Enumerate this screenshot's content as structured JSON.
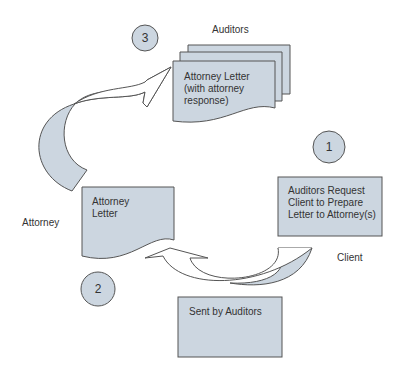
{
  "diagram": {
    "steps": [
      {
        "number": "1",
        "box_text_lines": [
          "Auditors Request",
          "Client to Prepare",
          "Letter to Attorney(s)"
        ],
        "party_label": "Client"
      },
      {
        "number": "2",
        "box_text_lines": [
          "Attorney",
          "Letter"
        ],
        "party_label": "Attorney"
      },
      {
        "number": "3",
        "box_text_lines": [
          "Attorney Letter",
          "(with attorney",
          "response)"
        ],
        "party_label": "Auditors"
      }
    ],
    "note_box": "Sent by Auditors"
  },
  "colors": {
    "fill": "#ccd6e0",
    "stroke": "#555555"
  }
}
